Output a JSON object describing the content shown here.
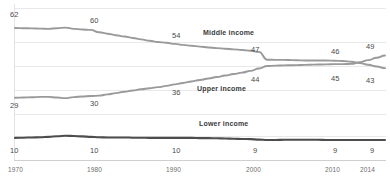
{
  "chart_data": {
    "type": "line",
    "title": "",
    "subtitle": "",
    "xlabel": "",
    "ylabel": "",
    "grid": true,
    "legend_position": "inline",
    "xlim": [
      1970,
      2014
    ],
    "ylim": [
      0,
      68
    ],
    "x": [
      1970,
      1980,
      1990,
      2000,
      2010,
      2014
    ],
    "tick_labels_x": [
      "1970",
      "1980",
      "1990",
      "2000",
      "2010",
      "2014"
    ],
    "series": [
      {
        "name": "Middle income",
        "color": "#9a9a9a",
        "values": [
          62,
          60,
          54,
          47,
          46,
          43
        ],
        "point_labels": [
          "62",
          "60",
          "54",
          "47",
          "46",
          "43"
        ],
        "x": [
          1970,
          1980,
          1990,
          2000,
          2010,
          2014
        ],
        "detail_x": [
          1970,
          1971,
          1972,
          1973,
          1974,
          1975,
          1976,
          1977,
          1978,
          1979,
          1980,
          1981,
          1982,
          1983,
          1984,
          1985,
          1986,
          1987,
          1988,
          1989,
          1990,
          1991,
          1992,
          1993,
          1994,
          1995,
          1996,
          1997,
          1998,
          1999,
          2000,
          2001,
          2002,
          2003,
          2004,
          2005,
          2006,
          2007,
          2008,
          2009,
          2010,
          2011,
          2012,
          2013,
          2014
        ],
        "detail_y": [
          62,
          61.9,
          61.8,
          61.7,
          61.6,
          61.9,
          62.2,
          61.6,
          61.3,
          61.1,
          60,
          59.3,
          58.6,
          58,
          57.3,
          56.6,
          56,
          55.4,
          55,
          54.5,
          54,
          53.6,
          53.2,
          52.8,
          52.5,
          52.2,
          51.9,
          51.6,
          51.2,
          50.7,
          47,
          46.9,
          46.9,
          46.8,
          46.7,
          46.6,
          46.6,
          46.6,
          46.5,
          46.4,
          46,
          45.4,
          44.6,
          43.8,
          43
        ]
      },
      {
        "name": "Upper income",
        "color": "#9a9a9a",
        "values": [
          29,
          30,
          36,
          44,
          45,
          49
        ],
        "point_labels": [
          "29",
          "30",
          "36",
          "44",
          "45",
          "49"
        ],
        "x": [
          1970,
          1980,
          1990,
          2000,
          2010,
          2014
        ],
        "detail_x": [
          1970,
          1971,
          1972,
          1973,
          1974,
          1975,
          1976,
          1977,
          1978,
          1979,
          1980,
          1981,
          1982,
          1983,
          1984,
          1985,
          1986,
          1987,
          1988,
          1989,
          1990,
          1991,
          1992,
          1993,
          1994,
          1995,
          1996,
          1997,
          1998,
          1999,
          2000,
          2001,
          2002,
          2003,
          2004,
          2005,
          2006,
          2007,
          2008,
          2009,
          2010,
          2011,
          2012,
          2013,
          2014
        ],
        "detail_y": [
          29,
          29.1,
          29.2,
          29.4,
          29.4,
          29.1,
          28.8,
          29.3,
          29.6,
          29.8,
          30,
          30.6,
          31.2,
          31.8,
          32.4,
          33,
          33.5,
          34,
          34.6,
          35.3,
          36,
          36.7,
          37.4,
          38.1,
          38.8,
          39.5,
          40.2,
          40.9,
          41.7,
          42.8,
          44,
          44.2,
          44.3,
          44.4,
          44.5,
          44.6,
          44.7,
          44.8,
          44.9,
          44.9,
          45,
          45.8,
          46.8,
          47.9,
          49
        ]
      },
      {
        "name": "Lower income",
        "color": "#4d4d4d",
        "values": [
          10,
          10,
          10,
          9,
          9,
          9
        ],
        "point_labels": [
          "10",
          "10",
          "10",
          "9",
          "9",
          "9"
        ],
        "x": [
          1970,
          1980,
          1990,
          2000,
          2010,
          2014
        ],
        "detail_x": [
          1970,
          1971,
          1972,
          1973,
          1974,
          1975,
          1976,
          1977,
          1978,
          1979,
          1980,
          1981,
          1982,
          1983,
          1984,
          1985,
          1986,
          1987,
          1988,
          1989,
          1990,
          1991,
          1992,
          1993,
          1994,
          1995,
          1996,
          1997,
          1998,
          1999,
          2000,
          2001,
          2002,
          2003,
          2004,
          2005,
          2006,
          2007,
          2008,
          2009,
          2010,
          2011,
          2012,
          2013,
          2014
        ],
        "detail_y": [
          10,
          10.1,
          10.2,
          10.3,
          10.5,
          10.8,
          11,
          10.9,
          10.7,
          10.5,
          10.3,
          10.2,
          10.2,
          10.2,
          10.1,
          10.1,
          10,
          10,
          10,
          10,
          10,
          10,
          9.9,
          9.9,
          9.8,
          9.7,
          9.6,
          9.5,
          9.4,
          9.2,
          9,
          9,
          9.1,
          9.1,
          9.1,
          9.1,
          9.1,
          9,
          9,
          9,
          9,
          9,
          9,
          9,
          9
        ]
      }
    ],
    "value_labels": [
      {
        "text": "62",
        "x": 10,
        "y": 10,
        "series": "Middle income",
        "year": 1970
      },
      {
        "text": "60",
        "x": 90,
        "y": 16,
        "series": "Middle income",
        "year": 1980
      },
      {
        "text": "54",
        "x": 172,
        "y": 31,
        "series": "Middle income",
        "year": 1990
      },
      {
        "text": "47",
        "x": 251,
        "y": 45,
        "series": "Middle income",
        "year": 2000
      },
      {
        "text": "46",
        "x": 331,
        "y": 47,
        "series": "Middle income",
        "year": 2010
      },
      {
        "text": "49",
        "x": 366,
        "y": 42,
        "series": "Middle income",
        "year": 2014
      },
      {
        "text": "29",
        "x": 10,
        "y": 101,
        "series": "Upper income",
        "year": 1970
      },
      {
        "text": "30",
        "x": 90,
        "y": 99,
        "series": "Upper income",
        "year": 1980
      },
      {
        "text": "36",
        "x": 172,
        "y": 88,
        "series": "Upper income",
        "year": 1990
      },
      {
        "text": "44",
        "x": 251,
        "y": 75,
        "series": "Upper income",
        "year": 2000
      },
      {
        "text": "45",
        "x": 331,
        "y": 74,
        "series": "Upper income",
        "year": 2010
      },
      {
        "text": "43",
        "x": 366,
        "y": 76,
        "series": "Upper income",
        "year": 2014
      },
      {
        "text": "10",
        "x": 10,
        "y": 146,
        "series": "Lower income",
        "year": 1970
      },
      {
        "text": "10",
        "x": 90,
        "y": 146,
        "series": "Lower income",
        "year": 1980
      },
      {
        "text": "10",
        "x": 172,
        "y": 146,
        "series": "Lower income",
        "year": 1990
      },
      {
        "text": "9",
        "x": 253,
        "y": 146,
        "series": "Lower income",
        "year": 2000
      },
      {
        "text": "9",
        "x": 333,
        "y": 146,
        "series": "Lower income",
        "year": 2010
      },
      {
        "text": "9",
        "x": 370,
        "y": 146,
        "series": "Lower income",
        "year": 2014
      }
    ],
    "series_labels": [
      {
        "text": "Middle income",
        "x": 203,
        "y": 29
      },
      {
        "text": "Upper income",
        "x": 197,
        "y": 85
      },
      {
        "text": "Lower income",
        "x": 199,
        "y": 120
      }
    ],
    "x_ticks": [
      {
        "text": "1970",
        "x": 8
      },
      {
        "text": "1980",
        "x": 87
      },
      {
        "text": "1990",
        "x": 166
      },
      {
        "text": "2000",
        "x": 246
      },
      {
        "text": "2010",
        "x": 325
      },
      {
        "text": "2014",
        "x": 360
      }
    ],
    "gridlines_y": [
      8,
      42,
      66,
      90,
      114,
      136
    ],
    "axis_y": 160,
    "colors": {
      "middle_income": "#9a9a9a",
      "upper_income": "#9a9a9a",
      "lower_income": "#4d4d4d",
      "gridline": "#e9e9e9",
      "axis": "#cfcfcf",
      "label_text": "#4a4a4a",
      "tick_text": "#6d6d6d",
      "background": "#ffffff"
    }
  }
}
